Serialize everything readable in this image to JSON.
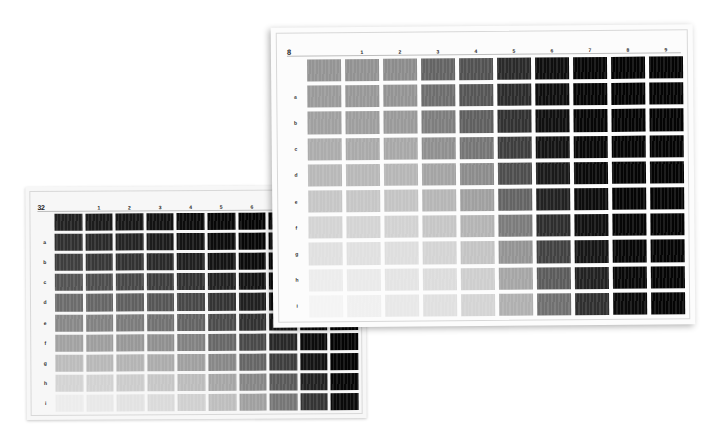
{
  "scene": {
    "title": "Two overlapping printed gray-scale density test charts",
    "background_color": "#ffffff"
  },
  "sheets": [
    {
      "id": "left-chart",
      "corner_label": "32",
      "paper_color": "#f7f7f7",
      "column_headers": [
        "1",
        "2",
        "3",
        "4",
        "5",
        "6",
        "7",
        "8",
        "9"
      ],
      "row_headers": [
        "",
        "a",
        "b",
        "c",
        "d",
        "e",
        "f",
        "g",
        "h",
        "i"
      ],
      "occluded_columns": [
        "8",
        "9"
      ],
      "note": "columns 8 and 9 are mostly hidden beneath the right-hand chart"
    },
    {
      "id": "right-chart",
      "corner_label": "8",
      "paper_color": "#fcfcfc",
      "column_headers": [
        "1",
        "2",
        "3",
        "4",
        "5",
        "6",
        "7",
        "8",
        "9"
      ],
      "row_headers": [
        "",
        "a",
        "b",
        "c",
        "d",
        "e",
        "f",
        "g",
        "h",
        "i"
      ]
    }
  ],
  "chart_data": [
    {
      "type": "heatmap",
      "id": "left-chart",
      "title": "32",
      "xlabel": "",
      "ylabel": "",
      "categories": [
        "0",
        "1",
        "2",
        "3",
        "4",
        "5",
        "6",
        "7",
        "8",
        "9"
      ],
      "rows": [
        "",
        "a",
        "b",
        "c",
        "d",
        "e",
        "f",
        "g",
        "h",
        "i"
      ],
      "value_unit": "gray level (0=black, 255=white)",
      "grid": true,
      "legend": "none",
      "values": [
        [
          34,
          28,
          24,
          18,
          12,
          8,
          5,
          3,
          2,
          2
        ],
        [
          48,
          42,
          36,
          28,
          20,
          12,
          7,
          4,
          3,
          2
        ],
        [
          62,
          56,
          50,
          42,
          32,
          20,
          11,
          6,
          3,
          2
        ],
        [
          84,
          78,
          72,
          62,
          50,
          34,
          20,
          9,
          4,
          2
        ],
        [
          108,
          102,
          96,
          86,
          72,
          52,
          32,
          14,
          5,
          3
        ],
        [
          136,
          130,
          124,
          114,
          100,
          76,
          50,
          24,
          8,
          3
        ],
        [
          162,
          158,
          152,
          144,
          130,
          104,
          74,
          40,
          12,
          4
        ],
        [
          188,
          184,
          180,
          172,
          160,
          136,
          102,
          62,
          20,
          5
        ],
        [
          212,
          210,
          204,
          198,
          188,
          166,
          134,
          90,
          34,
          7
        ],
        [
          236,
          232,
          226,
          218,
          208,
          190,
          160,
          118,
          52,
          10
        ]
      ],
      "colors": [
        [
          "#222222",
          "#1c1c1c",
          "#181818",
          "#121212",
          "#0c0c0c",
          "#080808",
          "#050505",
          "#030303",
          "#020202",
          "#020202"
        ],
        [
          "#303030",
          "#2a2a2a",
          "#242424",
          "#1c1c1c",
          "#141414",
          "#0c0c0c",
          "#070707",
          "#040404",
          "#030303",
          "#020202"
        ],
        [
          "#3e3e3e",
          "#383838",
          "#323232",
          "#2a2a2a",
          "#202020",
          "#141414",
          "#0b0b0b",
          "#060606",
          "#030303",
          "#020202"
        ],
        [
          "#545454",
          "#4e4e4e",
          "#484848",
          "#3e3e3e",
          "#323232",
          "#222222",
          "#141414",
          "#090909",
          "#040404",
          "#020202"
        ],
        [
          "#6c6c6c",
          "#666666",
          "#606060",
          "#565656",
          "#484848",
          "#343434",
          "#202020",
          "#0e0e0e",
          "#050505",
          "#030303"
        ],
        [
          "#888888",
          "#828282",
          "#7c7c7c",
          "#727272",
          "#646464",
          "#4c4c4c",
          "#323232",
          "#181818",
          "#080808",
          "#030303"
        ],
        [
          "#a2a2a2",
          "#9e9e9e",
          "#989898",
          "#909090",
          "#828282",
          "#686868",
          "#4a4a4a",
          "#282828",
          "#0c0c0c",
          "#040404"
        ],
        [
          "#bcbcbc",
          "#b8b8b8",
          "#b4b4b4",
          "#acacac",
          "#a0a0a0",
          "#888888",
          "#666666",
          "#3e3e3e",
          "#141414",
          "#050505"
        ],
        [
          "#d4d4d4",
          "#d2d2d2",
          "#cccccc",
          "#c6c6c6",
          "#bcbcbc",
          "#a6a6a6",
          "#868686",
          "#5a5a5a",
          "#222222",
          "#070707"
        ],
        [
          "#ececec",
          "#e8e8e8",
          "#e2e2e2",
          "#dadada",
          "#d0d0d0",
          "#bebebe",
          "#a0a0a0",
          "#767676",
          "#343434",
          "#0a0a0a"
        ]
      ]
    },
    {
      "type": "heatmap",
      "id": "right-chart",
      "title": "8",
      "xlabel": "",
      "ylabel": "",
      "categories": [
        "0",
        "1",
        "2",
        "3",
        "4",
        "5",
        "6",
        "7",
        "8",
        "9"
      ],
      "rows": [
        "",
        "a",
        "b",
        "c",
        "d",
        "e",
        "f",
        "g",
        "h",
        "i"
      ],
      "value_unit": "gray level (0=black, 255=white)",
      "grid": true,
      "legend": "none",
      "values": [
        [
          148,
          146,
          140,
          100,
          82,
          42,
          14,
          6,
          4,
          4
        ],
        [
          154,
          152,
          148,
          110,
          86,
          44,
          14,
          6,
          4,
          4
        ],
        [
          160,
          158,
          154,
          126,
          96,
          50,
          16,
          7,
          4,
          4
        ],
        [
          172,
          170,
          168,
          144,
          118,
          62,
          20,
          8,
          5,
          4
        ],
        [
          184,
          184,
          182,
          164,
          140,
          78,
          26,
          9,
          5,
          4
        ],
        [
          198,
          198,
          196,
          182,
          160,
          100,
          34,
          12,
          5,
          4
        ],
        [
          212,
          212,
          210,
          198,
          180,
          124,
          46,
          16,
          6,
          4
        ],
        [
          224,
          224,
          222,
          212,
          196,
          148,
          66,
          22,
          7,
          5
        ],
        [
          236,
          234,
          228,
          220,
          206,
          166,
          92,
          34,
          8,
          5
        ],
        [
          244,
          240,
          232,
          224,
          212,
          176,
          112,
          48,
          10,
          5
        ]
      ],
      "colors": [
        [
          "#949494",
          "#929292",
          "#8c8c8c",
          "#646464",
          "#525252",
          "#2a2a2a",
          "#0e0e0e",
          "#060606",
          "#040404",
          "#040404"
        ],
        [
          "#9a9a9a",
          "#989898",
          "#949494",
          "#6e6e6e",
          "#565656",
          "#2c2c2c",
          "#0e0e0e",
          "#060606",
          "#040404",
          "#040404"
        ],
        [
          "#a0a0a0",
          "#9e9e9e",
          "#9a9a9a",
          "#7e7e7e",
          "#606060",
          "#323232",
          "#101010",
          "#070707",
          "#040404",
          "#040404"
        ],
        [
          "#acacac",
          "#aaaaaa",
          "#a8a8a8",
          "#909090",
          "#767676",
          "#3e3e3e",
          "#141414",
          "#080808",
          "#050505",
          "#040404"
        ],
        [
          "#b8b8b8",
          "#b8b8b8",
          "#b6b6b6",
          "#a4a4a4",
          "#8c8c8c",
          "#4e4e4e",
          "#1a1a1a",
          "#090909",
          "#050505",
          "#040404"
        ],
        [
          "#c6c6c6",
          "#c6c6c6",
          "#c4c4c4",
          "#b6b6b6",
          "#a0a0a0",
          "#646464",
          "#222222",
          "#0c0c0c",
          "#050505",
          "#040404"
        ],
        [
          "#d4d4d4",
          "#d4d4d4",
          "#d2d2d2",
          "#c6c6c6",
          "#b4b4b4",
          "#7c7c7c",
          "#2e2e2e",
          "#101010",
          "#060606",
          "#040404"
        ],
        [
          "#e0e0e0",
          "#e0e0e0",
          "#dedede",
          "#d4d4d4",
          "#c4c4c4",
          "#949494",
          "#424242",
          "#161616",
          "#070707",
          "#050505"
        ],
        [
          "#ececec",
          "#eaeaea",
          "#e4e4e4",
          "#dcdcdc",
          "#cecece",
          "#a6a6a6",
          "#5c5c5c",
          "#222222",
          "#080808",
          "#050505"
        ],
        [
          "#f4f4f4",
          "#f0f0f0",
          "#e8e8e8",
          "#e0e0e0",
          "#d4d4d4",
          "#b0b0b0",
          "#707070",
          "#303030",
          "#0a0a0a",
          "#050505"
        ]
      ]
    }
  ]
}
